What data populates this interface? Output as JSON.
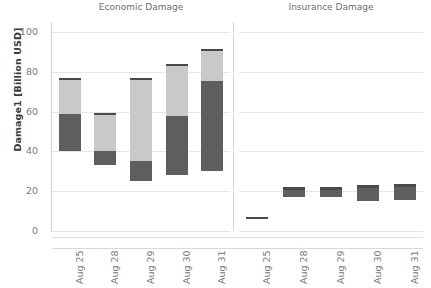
{
  "chart_data": {
    "type": "bar",
    "title": "",
    "subtitle": "",
    "xlabel": "",
    "ylabel": "Damage1 [Billion USD]",
    "ylim": [
      0,
      105
    ],
    "yticks": [
      0,
      20,
      40,
      60,
      80,
      100
    ],
    "ytick_labels": [
      "0",
      "20",
      "40",
      "60",
      "80",
      "100"
    ],
    "grid": true,
    "legend": "none",
    "orientation": "vertical",
    "bar_style": "floating-stacked-range",
    "panels": [
      {
        "name": "economic-damage",
        "title": "Economic Damage",
        "categories": [
          "Aug 25",
          "Aug 28",
          "Aug 29",
          "Aug 30",
          "Aug 31"
        ],
        "series": [
          {
            "name": "Lower segment (dark)",
            "color": "#5e5e5e",
            "ranges": [
              {
                "category": "Aug 25",
                "low": 40.0,
                "high": 59.0
              },
              {
                "category": "Aug 28",
                "low": 33.0,
                "high": 40.0
              },
              {
                "category": "Aug 29",
                "low": 25.0,
                "high": 35.0
              },
              {
                "category": "Aug 30",
                "low": 28.0,
                "high": 58.0
              },
              {
                "category": "Aug 31",
                "low": 30.0,
                "high": 75.5
              }
            ]
          },
          {
            "name": "Upper segment (light)",
            "color": "#c9c9c9",
            "ranges": [
              {
                "category": "Aug 25",
                "low": 59.0,
                "high": 77.0
              },
              {
                "category": "Aug 28",
                "low": 40.0,
                "high": 59.5
              },
              {
                "category": "Aug 29",
                "low": 35.0,
                "high": 77.0
              },
              {
                "category": "Aug 30",
                "low": 58.0,
                "high": 84.0
              },
              {
                "category": "Aug 31",
                "low": 75.5,
                "high": 91.5
              }
            ]
          }
        ],
        "totals": [
          {
            "category": "Aug 25",
            "min": 40.0,
            "max": 77.0
          },
          {
            "category": "Aug 28",
            "min": 33.0,
            "max": 59.5
          },
          {
            "category": "Aug 29",
            "min": 25.0,
            "max": 77.0
          },
          {
            "category": "Aug 30",
            "min": 28.0,
            "max": 84.0
          },
          {
            "category": "Aug 31",
            "min": 30.0,
            "max": 91.5
          }
        ]
      },
      {
        "name": "insurance-damage",
        "title": "Insurance Damage",
        "categories": [
          "Aug 25",
          "Aug 28",
          "Aug 29",
          "Aug 30",
          "Aug 31"
        ],
        "series": [
          {
            "name": "Lower segment (dark)",
            "color": "#5e5e5e",
            "ranges": [
              {
                "category": "Aug 25",
                "low": 6.5,
                "high": 6.8
              },
              {
                "category": "Aug 28",
                "low": 17.0,
                "high": 21.5
              },
              {
                "category": "Aug 29",
                "low": 17.0,
                "high": 21.5
              },
              {
                "category": "Aug 30",
                "low": 15.0,
                "high": 22.5
              },
              {
                "category": "Aug 31",
                "low": 15.5,
                "high": 23.0
              }
            ]
          },
          {
            "name": "Upper segment (light)",
            "color": "#c9c9c9",
            "ranges": [
              {
                "category": "Aug 25",
                "low": 6.8,
                "high": 6.8
              },
              {
                "category": "Aug 28",
                "low": 21.5,
                "high": 22.0
              },
              {
                "category": "Aug 29",
                "low": 21.5,
                "high": 22.0
              },
              {
                "category": "Aug 30",
                "low": 22.5,
                "high": 23.0
              },
              {
                "category": "Aug 31",
                "low": 23.0,
                "high": 23.5
              }
            ]
          }
        ],
        "totals": [
          {
            "category": "Aug 25",
            "min": 6.5,
            "max": 6.8
          },
          {
            "category": "Aug 28",
            "min": 17.0,
            "max": 22.0
          },
          {
            "category": "Aug 29",
            "min": 17.0,
            "max": 22.0
          },
          {
            "category": "Aug 30",
            "min": 15.0,
            "max": 23.0
          },
          {
            "category": "Aug 31",
            "min": 15.5,
            "max": 23.5
          }
        ]
      }
    ],
    "colors": {
      "dark_segment": "#5e5e5e",
      "light_segment": "#c9c9c9",
      "cap": "#4a4a4a",
      "gridline": "#e6e6e6",
      "axis": "#d4d4d4",
      "tick_text": "#7a7a7a",
      "title_text": "#6e6e6e",
      "axis_title_text": "#3b3b3b",
      "background": "#ffffff"
    }
  }
}
